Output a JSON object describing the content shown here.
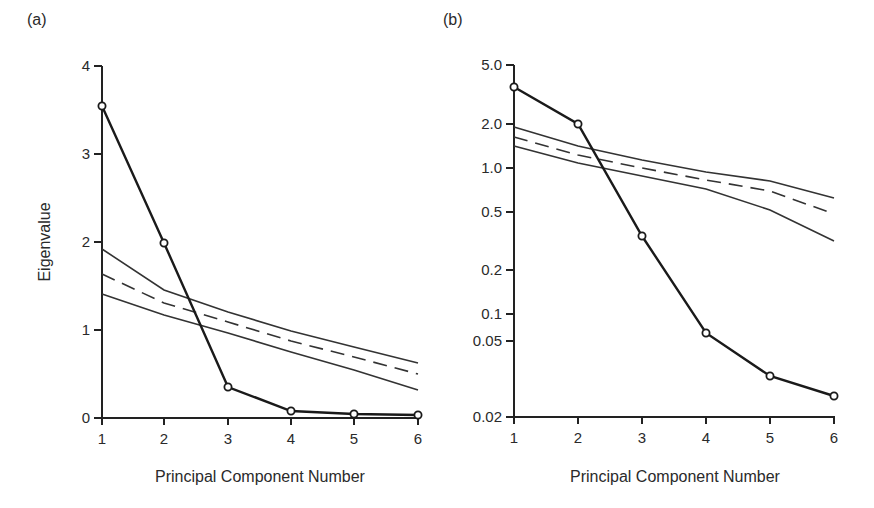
{
  "chart_data": [
    {
      "panel_label": "(a)",
      "type": "line",
      "title": "",
      "xlabel": "Principal Component Number",
      "ylabel": "Eigenvalue",
      "yscale": "linear",
      "ylim": [
        0,
        4
      ],
      "xlim": [
        1,
        6
      ],
      "grid": false,
      "x": [
        1,
        2,
        3,
        4,
        5,
        6
      ],
      "x_tick_labels": [
        "1",
        "2",
        "3",
        "4",
        "5",
        "6"
      ],
      "y_ticks": [
        0,
        1,
        2,
        3,
        4
      ],
      "y_tick_labels": [
        "0",
        "1",
        "2",
        "3",
        "4"
      ],
      "series": [
        {
          "name": "Observed eigenvalues",
          "style": "solid-bold-markers",
          "values": [
            3.55,
            1.98,
            0.35,
            0.08,
            0.04,
            0.03
          ]
        },
        {
          "name": "Upper bound",
          "style": "solid-thin",
          "values": [
            1.92,
            1.45,
            1.2,
            0.99,
            0.81,
            0.63
          ]
        },
        {
          "name": "Mean (random)",
          "style": "dashed",
          "values": [
            1.63,
            1.31,
            1.09,
            0.88,
            0.69,
            0.5
          ]
        },
        {
          "name": "Lower bound",
          "style": "solid-thin",
          "values": [
            1.41,
            1.17,
            0.97,
            0.75,
            0.55,
            0.32
          ]
        }
      ]
    },
    {
      "panel_label": "(b)",
      "type": "line",
      "title": "",
      "xlabel": "Principal Component Number",
      "ylabel": "",
      "yscale": "log",
      "ylim": [
        0.02,
        5.0
      ],
      "xlim": [
        1,
        6
      ],
      "grid": false,
      "x": [
        1,
        2,
        3,
        4,
        5,
        6
      ],
      "x_tick_labels": [
        "1",
        "2",
        "3",
        "4",
        "5",
        "6"
      ],
      "y_ticks": [
        0.02,
        0.05,
        0.1,
        0.2,
        0.5,
        1.0,
        2.0,
        5.0
      ],
      "y_tick_labels": [
        "0.02",
        "0.05",
        "0.1",
        "0.2",
        "0.5",
        "1.0",
        "2.0",
        "5.0"
      ],
      "series": [
        {
          "name": "Observed eigenvalues",
          "style": "solid-bold-markers",
          "values": [
            3.55,
            1.98,
            0.34,
            0.06,
            0.033,
            0.026
          ]
        },
        {
          "name": "Upper bound",
          "style": "solid-thin",
          "values": [
            1.92,
            1.45,
            1.2,
            0.99,
            0.81,
            0.63
          ]
        },
        {
          "name": "Mean (random)",
          "style": "dashed",
          "values": [
            1.63,
            1.31,
            1.09,
            0.88,
            0.69,
            0.5
          ]
        },
        {
          "name": "Lower bound",
          "style": "solid-thin",
          "values": [
            1.41,
            1.17,
            0.97,
            0.75,
            0.55,
            0.32
          ]
        }
      ]
    }
  ],
  "layout": {
    "panels": [
      {
        "x_px": [
          102,
          164,
          228,
          291,
          354,
          418
        ],
        "y_ticks_px": [
          418,
          330,
          242,
          154,
          66
        ],
        "axis_x": 102,
        "axis_bottom": 418,
        "axis_top": 66,
        "panel_label_pos": [
          27,
          25
        ],
        "ylabel_pos": [
          50,
          242
        ],
        "xlabel_pos": [
          260,
          476
        ],
        "lines_px": {
          "observed": [
            106,
            243,
            387,
            411,
            414,
            415
          ],
          "upper": [
            249,
            290,
            312,
            331,
            347,
            363
          ],
          "dashed": [
            274,
            303,
            322,
            341,
            357,
            374
          ],
          "lower": [
            294,
            315,
            333,
            352,
            370,
            390
          ]
        }
      },
      {
        "x_px": [
          514,
          578,
          642,
          706,
          770,
          834
        ],
        "y_ticks_px": [
          417,
          341,
          314,
          270,
          212,
          168,
          124,
          65
        ],
        "axis_x": 514,
        "axis_bottom": 417,
        "axis_top": 65,
        "panel_label_pos": [
          443,
          25
        ],
        "xlabel_pos": [
          675,
          476
        ],
        "lines_px": {
          "observed": [
            87,
            124,
            236,
            333,
            376,
            396
          ],
          "upper": [
            127,
            146,
            160,
            172,
            181,
            198
          ],
          "dashed": [
            137,
            155,
            168,
            180,
            191,
            214
          ],
          "lower": [
            146,
            163,
            176,
            189,
            210,
            241
          ]
        }
      }
    ]
  }
}
